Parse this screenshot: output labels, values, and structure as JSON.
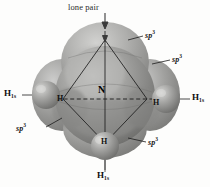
{
  "figure": {
    "background_color": "#fdfdfc",
    "orbital_color": "#8e8e8e",
    "sphere_color": "#9a9a9a",
    "line_color": "#1a1a1a"
  },
  "labels": {
    "lone_pair": "lone pair",
    "center_atom": "N",
    "sp3_top_right": "sp",
    "sp3_top_right_sup": "3",
    "sp3_right": "sp",
    "sp3_right_sup": "3",
    "sp3_lower_left": "sp",
    "sp3_lower_left_sup": "3",
    "sp3_lower_right": "sp",
    "sp3_lower_right_sup": "3",
    "h_left": "H",
    "h_left_sub": "1s",
    "h_right": "H",
    "h_right_sub": "1s",
    "h_bottom": "H",
    "h_bottom_sub": "1s",
    "atom_h_left": "H",
    "atom_h_right": "H",
    "atom_h_bottom": "H"
  },
  "annotations": {
    "arrow_lone_pair": "down-arrow",
    "leader_sp3_top_right": "leader-line",
    "leader_sp3_right": "leader-line",
    "leader_sp3_lower_left": "leader-line",
    "leader_sp3_lower_right": "leader-line",
    "axis_vertical": "vertical-axis",
    "axis_horizontal_dashed": "dashed-horizontal-axis"
  }
}
